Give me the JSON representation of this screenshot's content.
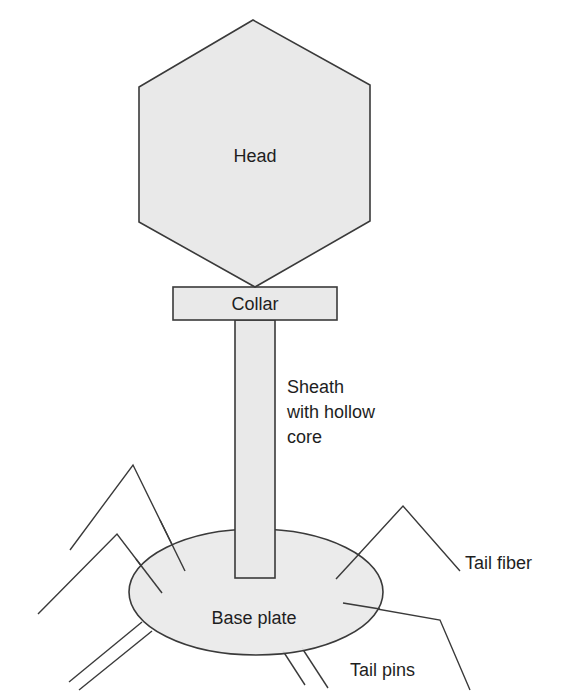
{
  "diagram": {
    "title": "",
    "type": "bacteriophage structure",
    "colors": {
      "fill": "#e9e9e9",
      "stroke": "#3a3a3a",
      "text": "#1e1e1e"
    },
    "labels": {
      "head": "Head",
      "collar": "Collar",
      "sheath_line1": "Sheath",
      "sheath_line2": "with hollow",
      "sheath_line3": "core",
      "base_plate": "Base plate",
      "tail_fiber": "Tail fiber",
      "tail_pins": "Tail pins"
    },
    "parts": [
      {
        "name": "Head",
        "shape": "hexagon"
      },
      {
        "name": "Collar",
        "shape": "rectangle"
      },
      {
        "name": "Sheath with hollow core",
        "shape": "rectangle"
      },
      {
        "name": "Base plate",
        "shape": "ellipse"
      },
      {
        "name": "Tail fiber",
        "shape": "bent line",
        "count": 4
      },
      {
        "name": "Tail pins",
        "shape": "line pair",
        "count": 2
      }
    ]
  }
}
